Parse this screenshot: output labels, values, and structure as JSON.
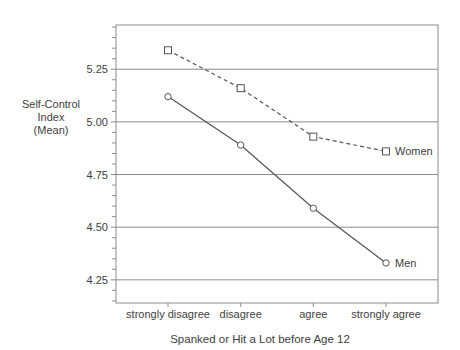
{
  "chart_data": {
    "type": "line",
    "title": "",
    "xlabel": "Spanked or Hit a Lot before Age 12",
    "ylabel": "Self-Control Index (Mean)",
    "ylabel_lines": [
      "Self-Control",
      "Index",
      "(Mean)"
    ],
    "categories": [
      "strongly disagree",
      "disagree",
      "agree",
      "strongly agree"
    ],
    "series": [
      {
        "name": "Women",
        "values": [
          5.34,
          5.16,
          4.93,
          4.86
        ],
        "line_style": "dashed",
        "marker": "square"
      },
      {
        "name": "Men",
        "values": [
          5.12,
          4.89,
          4.59,
          4.33
        ],
        "line_style": "solid",
        "marker": "circle"
      }
    ],
    "ylim": [
      4.14,
      5.46
    ],
    "yticks": [
      5.25,
      5.0,
      4.75,
      4.5,
      4.25
    ],
    "ytick_labels": [
      "5.25",
      "5.00",
      "4.75",
      "4.50",
      "4.25"
    ],
    "minor_tick_step": 0.05,
    "grid": "horizontal",
    "legend_position": "end-of-line-labels",
    "colors": {
      "line": "#555555",
      "marker_fill": "#ffffff",
      "grid": "#8c8c8c",
      "text": "#404040",
      "background": "#ffffff"
    }
  }
}
